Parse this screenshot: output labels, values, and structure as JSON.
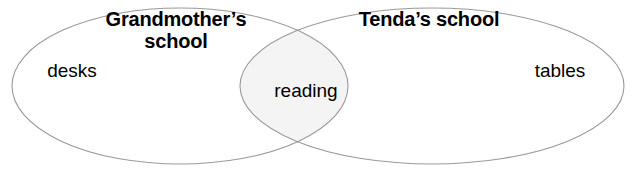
{
  "diagram": {
    "type": "venn",
    "sets": [
      {
        "id": "left",
        "title": "Grandmother’s\nschool",
        "items": [
          "desks"
        ]
      },
      {
        "id": "right",
        "title": "Tenda’s school",
        "items": [
          "tables"
        ]
      }
    ],
    "overlap": {
      "items": [
        "reading"
      ]
    },
    "colors": {
      "stroke": "#999999",
      "overlap_fill": "#f4f4f4",
      "background": "#ffffff",
      "text": "#000000"
    }
  }
}
